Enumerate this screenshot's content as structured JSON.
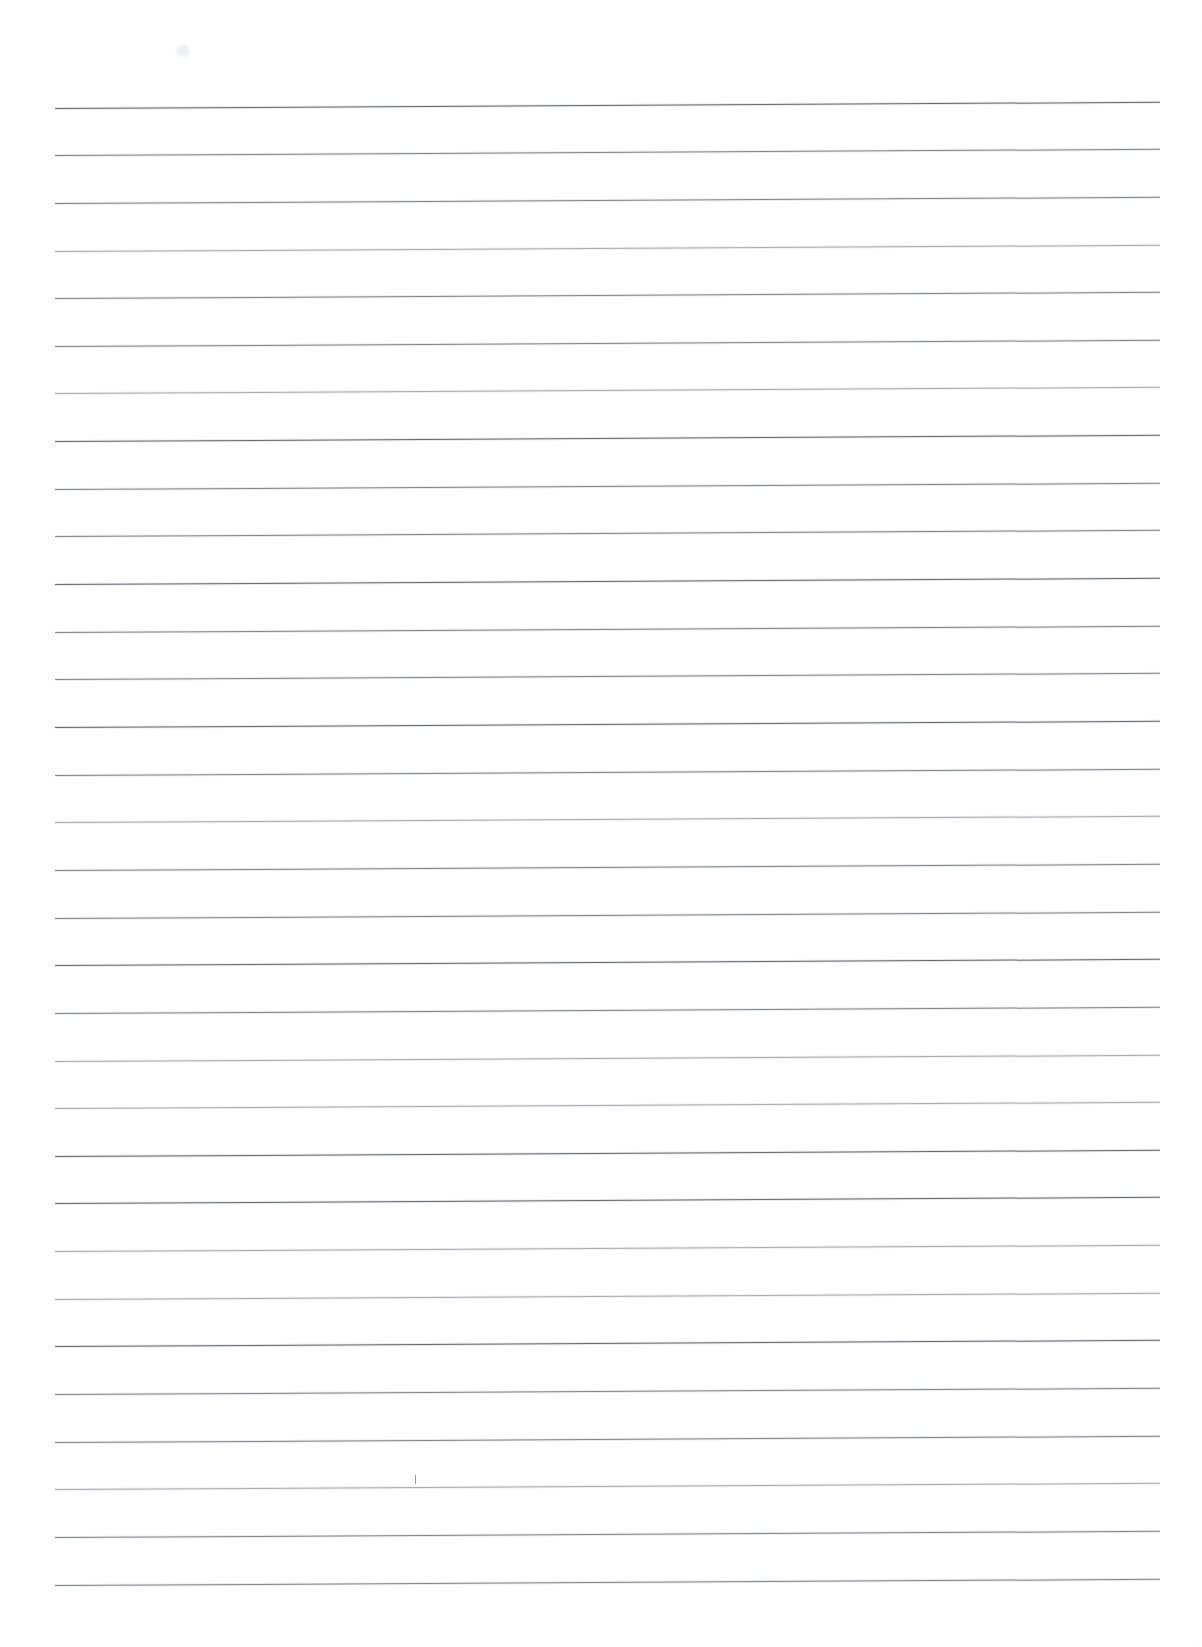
{
  "document": {
    "type": "scanned-ruled-paper",
    "title": "Blank ruled notebook page",
    "page_width": 1202,
    "page_height": 1647,
    "background_color": "#ffffff",
    "rule_color": "#6f7076",
    "content_text": "",
    "handwriting_present": "none",
    "orientation": "portrait"
  },
  "ruling": {
    "line_count": 32,
    "left_margin_x": 55,
    "right_end_x": 1160,
    "line_spacing_px": 47.7,
    "first_line_y": 108,
    "slope_degrees": -0.32,
    "line_thickness_px": 1
  },
  "lines": [
    {
      "index": 1,
      "y": 108,
      "weight": "dark"
    },
    {
      "index": 2,
      "y": 155,
      "weight": "normal"
    },
    {
      "index": 3,
      "y": 203,
      "weight": "normal"
    },
    {
      "index": 4,
      "y": 251,
      "weight": "light"
    },
    {
      "index": 5,
      "y": 298,
      "weight": "normal"
    },
    {
      "index": 6,
      "y": 346,
      "weight": "normal"
    },
    {
      "index": 7,
      "y": 393,
      "weight": "light"
    },
    {
      "index": 8,
      "y": 441,
      "weight": "dark"
    },
    {
      "index": 9,
      "y": 489,
      "weight": "normal"
    },
    {
      "index": 10,
      "y": 536,
      "weight": "normal"
    },
    {
      "index": 11,
      "y": 584,
      "weight": "dark"
    },
    {
      "index": 12,
      "y": 632,
      "weight": "normal"
    },
    {
      "index": 13,
      "y": 679,
      "weight": "normal"
    },
    {
      "index": 14,
      "y": 727,
      "weight": "dark"
    },
    {
      "index": 15,
      "y": 775,
      "weight": "normal"
    },
    {
      "index": 16,
      "y": 822,
      "weight": "light"
    },
    {
      "index": 17,
      "y": 870,
      "weight": "normal"
    },
    {
      "index": 18,
      "y": 918,
      "weight": "normal"
    },
    {
      "index": 19,
      "y": 965,
      "weight": "dark"
    },
    {
      "index": 20,
      "y": 1013,
      "weight": "normal"
    },
    {
      "index": 21,
      "y": 1061,
      "weight": "light"
    },
    {
      "index": 22,
      "y": 1108,
      "weight": "light"
    },
    {
      "index": 23,
      "y": 1156,
      "weight": "dark"
    },
    {
      "index": 24,
      "y": 1203,
      "weight": "dark"
    },
    {
      "index": 25,
      "y": 1251,
      "weight": "light"
    },
    {
      "index": 26,
      "y": 1299,
      "weight": "light"
    },
    {
      "index": 27,
      "y": 1346,
      "weight": "dark"
    },
    {
      "index": 28,
      "y": 1394,
      "weight": "normal"
    },
    {
      "index": 29,
      "y": 1442,
      "weight": "normal"
    },
    {
      "index": 30,
      "y": 1489,
      "weight": "light"
    },
    {
      "index": 31,
      "y": 1537,
      "weight": "normal"
    },
    {
      "index": 32,
      "y": 1585,
      "weight": "normal"
    }
  ],
  "artifacts": [
    {
      "name": "scan-smudge-top-left",
      "x": 176,
      "y": 45,
      "width": 14,
      "height": 12
    },
    {
      "name": "pen-tick-mark",
      "x": 415,
      "y": 1475,
      "width": 1,
      "height": 9
    }
  ]
}
